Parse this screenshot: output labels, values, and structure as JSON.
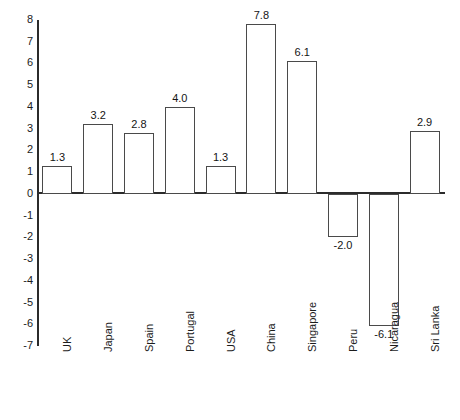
{
  "chart_data": {
    "type": "bar",
    "title": "",
    "subtitle": "",
    "xlabel": "",
    "ylabel": "",
    "categories": [
      "UK",
      "Japan",
      "Spain",
      "Portugal",
      "USA",
      "China",
      "Singapore",
      "Peru",
      "Nicaragua",
      "Sri Lanka"
    ],
    "values": [
      1.3,
      3.2,
      2.8,
      4.0,
      1.3,
      7.8,
      6.1,
      -2.0,
      -6.1,
      2.9
    ],
    "value_labels": [
      "1.3",
      "3.2",
      "2.8",
      "4.0",
      "1.3",
      "7.8",
      "6.1",
      "-2.0",
      "-6.1",
      "2.9"
    ],
    "ylim": [
      -7,
      8
    ],
    "yticks": [
      8,
      7,
      6,
      5,
      4,
      3,
      2,
      1,
      0,
      -1,
      -2,
      -3,
      -4,
      -5,
      -6,
      -7
    ],
    "ytick_labels": [
      "8",
      "7",
      "6",
      "5",
      "4",
      "3",
      "2",
      "1",
      "0",
      "-1",
      "-2",
      "-3",
      "-4",
      "-5",
      "-6",
      "-7"
    ],
    "grid": false,
    "legend": null,
    "legend_position": "none",
    "bar_fill_color": "#ffffff",
    "bar_border_color": "#4a4a4a",
    "axis_color": "#2b2b2b",
    "text_color": "#1c1c1c",
    "label_rotation_degrees": 90
  }
}
